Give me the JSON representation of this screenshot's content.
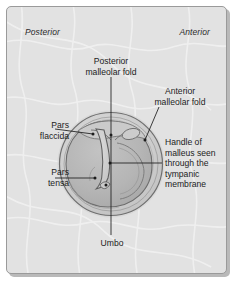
{
  "figure": {
    "panel_background": "#e2e2e2",
    "panel_border": "#9a9a9a",
    "ink": "#1c1c1c"
  },
  "orientation": {
    "left_label": "Posterior",
    "right_label": "Anterior"
  },
  "labels": {
    "posterior_malleolar_fold": "Posterior\nmalleolar fold",
    "anterior_malleolar_fold": "Anterior\nmalleolar fold",
    "handle_of_malleus": "Handle of\nmalleus seen\nthrough the\ntympanic\nmembrane",
    "pars_flaccida": "Pars\nflaccida",
    "pars_tensa": "Pars\ntensa",
    "umbo": "Umbo"
  },
  "anatomy": {
    "structures": [
      "Posterior malleolar fold",
      "Anterior malleolar fold",
      "Handle of malleus seen through the tympanic membrane",
      "Pars flaccida",
      "Pars tensa",
      "Umbo"
    ],
    "membrane_fill": "#bdbdbd",
    "pars_tensa_fill": "#b0b0b0",
    "rim_fill": "#cfcfcf",
    "outline_color": "#6a6a6a"
  }
}
